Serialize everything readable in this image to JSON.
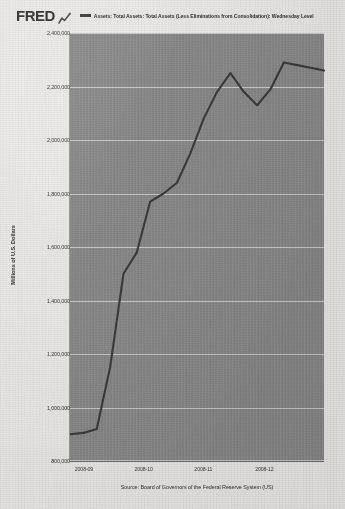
{
  "brand": {
    "logo_text": "FRED",
    "logo_icon": "chart-squiggle-icon"
  },
  "legend": {
    "marker": "line-swatch-icon",
    "label": "Assets: Total Assets: Total Assets (Less Eliminations from Consolidation): Wednesday Level",
    "color": "#3b3b3b"
  },
  "source": {
    "text": "Source: Board of Governors of the Federal Reserve System (US)"
  },
  "chart_data": {
    "type": "line",
    "title": "",
    "subtitle": "",
    "xlabel": "",
    "ylabel": "Millions of U.S. Dollars",
    "series": [
      {
        "name": "Assets: Total Assets: Total Assets (Less Eliminations from Consolidation): Wednesday Level",
        "color": "#3b3b3b",
        "x": [
          "2008-08-27",
          "2008-09-03",
          "2008-09-10",
          "2008-09-17",
          "2008-09-24",
          "2008-10-01",
          "2008-10-08",
          "2008-10-15",
          "2008-10-22",
          "2008-10-29",
          "2008-11-05",
          "2008-11-12",
          "2008-11-19",
          "2008-11-26",
          "2008-12-03",
          "2008-12-10",
          "2008-12-17",
          "2008-12-24",
          "2008-12-31",
          "2009-01-07"
        ],
        "values": [
          900000,
          905000,
          920000,
          1150000,
          1500000,
          1580000,
          1770000,
          1800000,
          1840000,
          1950000,
          2080000,
          2180000,
          2250000,
          2180000,
          2130000,
          2190000,
          2290000,
          2280000,
          2270000,
          2260000
        ]
      }
    ],
    "ylim": [
      800000,
      2400000
    ],
    "ytick_labels": [
      "2,400,000",
      "2,200,000",
      "2,000,000",
      "1,800,000",
      "1,600,000",
      "1,400,000",
      "1,200,000",
      "1,000,000",
      "800,000"
    ],
    "ytick_values": [
      2400000,
      2200000,
      2000000,
      1800000,
      1600000,
      1400000,
      1200000,
      1000000,
      800000
    ],
    "xtick_labels": [
      "2008-09",
      "2008-10",
      "2008-11",
      "2008-12"
    ],
    "xtick_positions": [
      0.055,
      0.29,
      0.525,
      0.765
    ],
    "grid": true,
    "legend_position": "top",
    "plot_bg": "#8b8b8b",
    "grid_color": "#ffffff"
  }
}
